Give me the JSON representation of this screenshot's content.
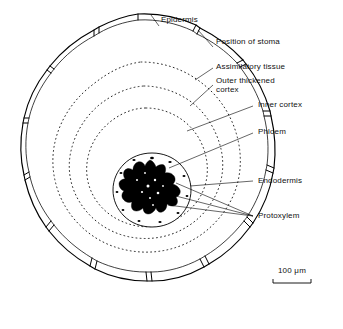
{
  "figure": {
    "kind": "botanical-cross-section-diagram",
    "background_color": "#ffffff",
    "ink_color": "#000000"
  },
  "labels": {
    "epidermis": "Epidermis",
    "position_of_stoma": "Position of stoma",
    "assimilatory_tissue": "Assimilatory tissue",
    "outer_thickened_cortex_line1": "Outer thickened",
    "outer_thickened_cortex_line2": "cortex",
    "inner_cortex": "Inner cortex",
    "phloem": "Phloem",
    "endodermis": "Endodermis",
    "protoxylem": "Protoxylem"
  },
  "scale_bar": {
    "value": "100",
    "unit": "μm",
    "text": "100 μm",
    "length_px": 38
  },
  "structures": [
    {
      "name": "epidermis",
      "style": "solid double outline, scalloped lobes"
    },
    {
      "name": "position of stoma",
      "style": "small gap segments between lobes"
    },
    {
      "name": "assimilatory tissue",
      "style": "region inside epidermis"
    },
    {
      "name": "outer thickened cortex",
      "style": "dotted ring"
    },
    {
      "name": "inner cortex",
      "style": "dotted ring"
    },
    {
      "name": "phloem",
      "style": "small dots around stele"
    },
    {
      "name": "endodermis",
      "style": "solid ring around stele"
    },
    {
      "name": "protoxylem",
      "style": "black star-shaped xylem mass"
    }
  ]
}
